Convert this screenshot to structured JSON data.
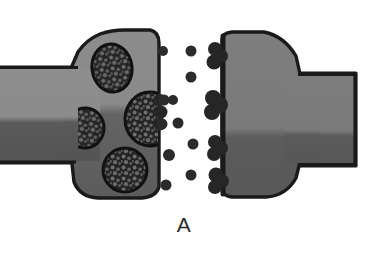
{
  "figure": {
    "panel_label": "A",
    "title": "",
    "background_color": "#ffffff"
  },
  "colors": {
    "outline": "#1a1a1a",
    "membrane_light": "#8c8c8c",
    "membrane_mid": "#7d7d7d",
    "membrane_dark": "#4e4e4e",
    "cytoplasm_light": "#878787",
    "cytoplasm_dark": "#5a5a5a",
    "vesicle_fill": "#2a2a2a",
    "vesicle_speckle": "#6e6e6e",
    "neurotransmitter": "#2b2b2b",
    "receptor": "#262626",
    "postsynaptic_light": "#7b7b7b",
    "postsynaptic_dark": "#5b5b5b",
    "label_text": "#2b2b2b"
  },
  "structures": {
    "presynaptic_terminal": {
      "name": "presynaptic-axon-terminal",
      "side": "left",
      "shape": "bulb",
      "bands": [
        {
          "name": "upper-light-band",
          "color": "#8c8c8c"
        },
        {
          "name": "lower-dark-band",
          "color": "#5a5a5a"
        }
      ]
    },
    "presynaptic_axon": {
      "name": "presynaptic-axon-shaft",
      "side": "left",
      "extends_to_edge": true
    },
    "postsynaptic_terminal": {
      "name": "postsynaptic-dendrite-terminal",
      "side": "right",
      "shape": "bulb",
      "bands": [
        {
          "name": "upper-light-band",
          "color": "#7b7b7b"
        },
        {
          "name": "lower-dark-band",
          "color": "#5b5b5b"
        }
      ]
    },
    "postsynaptic_axon": {
      "name": "postsynaptic-dendrite-shaft",
      "side": "right",
      "extends_to_edge": true
    },
    "synaptic_cleft": {
      "name": "synaptic-cleft",
      "x_range": [
        158,
        214
      ]
    }
  },
  "vesicles": [
    {
      "id": "vesicle-1",
      "cx": 112,
      "cy": 68,
      "rx": 20,
      "ry": 24,
      "rot": -8,
      "state": "free"
    },
    {
      "id": "vesicle-2",
      "cx": 85,
      "cy": 128,
      "rx": 19,
      "ry": 20,
      "rot": 5,
      "state": "free"
    },
    {
      "id": "vesicle-3",
      "cx": 125,
      "cy": 170,
      "rx": 22,
      "ry": 22,
      "rot": 0,
      "state": "free"
    },
    {
      "id": "vesicle-4",
      "cx": 148,
      "cy": 119,
      "rx": 24,
      "ry": 26,
      "rot": 0,
      "state": "fusing"
    }
  ],
  "neurotransmitters": [
    {
      "id": "nt-1",
      "cx": 163,
      "cy": 51,
      "r": 5.0
    },
    {
      "id": "nt-2",
      "cx": 191,
      "cy": 51,
      "r": 5.5
    },
    {
      "id": "nt-3",
      "cx": 191,
      "cy": 77,
      "r": 5.5
    },
    {
      "id": "nt-4",
      "cx": 163,
      "cy": 100,
      "r": 5.5
    },
    {
      "id": "nt-5",
      "cx": 172,
      "cy": 100,
      "r": 5.0
    },
    {
      "id": "nt-6",
      "cx": 161,
      "cy": 124,
      "r": 5.5
    },
    {
      "id": "nt-7",
      "cx": 178,
      "cy": 123,
      "r": 5.5
    },
    {
      "id": "nt-8",
      "cx": 193,
      "cy": 144,
      "r": 5.5
    },
    {
      "id": "nt-9",
      "cx": 169,
      "cy": 155,
      "r": 6.0
    },
    {
      "id": "nt-10",
      "cx": 191,
      "cy": 175,
      "r": 5.5
    },
    {
      "id": "nt-11",
      "cx": 166,
      "cy": 185,
      "r": 5.5
    },
    {
      "id": "nt-12",
      "cx": 153,
      "cy": 119,
      "r": 5.0
    }
  ],
  "receptors": [
    {
      "id": "receptor-1",
      "cx": 215,
      "cy": 57,
      "scale": 1.0
    },
    {
      "id": "receptor-2",
      "cx": 214,
      "cy": 105,
      "scale": 1.15
    },
    {
      "id": "receptor-3",
      "cx": 215,
      "cy": 148,
      "scale": 1.0
    },
    {
      "id": "receptor-4",
      "cx": 216,
      "cy": 180,
      "scale": 1.0
    }
  ]
}
